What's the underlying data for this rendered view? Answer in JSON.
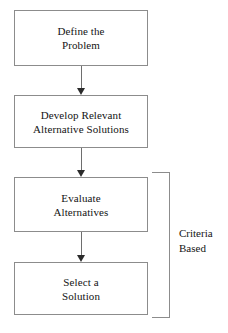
{
  "diagram": {
    "background_color": "#ffffff",
    "box_border_color": "#8c8c8c",
    "arrow_color": "#2b2b2b",
    "text_color": "#141414",
    "nodes": [
      {
        "id": "node-1",
        "label": "Define the\nProblem"
      },
      {
        "id": "node-2",
        "label": "Develop Relevant\nAlternative Solutions"
      },
      {
        "id": "node-3",
        "label": "Evaluate\nAlternatives"
      },
      {
        "id": "node-4",
        "label": "Select a\nSolution"
      }
    ],
    "connectors": [
      {
        "id": "connector-1",
        "from": "node-1",
        "to": "node-2",
        "style": "arrow-down"
      },
      {
        "id": "connector-2",
        "from": "node-2",
        "to": "node-3",
        "style": "arrow-down"
      },
      {
        "id": "connector-3",
        "from": "node-3",
        "to": "node-4",
        "style": "arrow-down"
      }
    ],
    "bracket": {
      "covers": [
        "node-3",
        "node-4"
      ],
      "caption": "Criteria\nBased"
    }
  }
}
